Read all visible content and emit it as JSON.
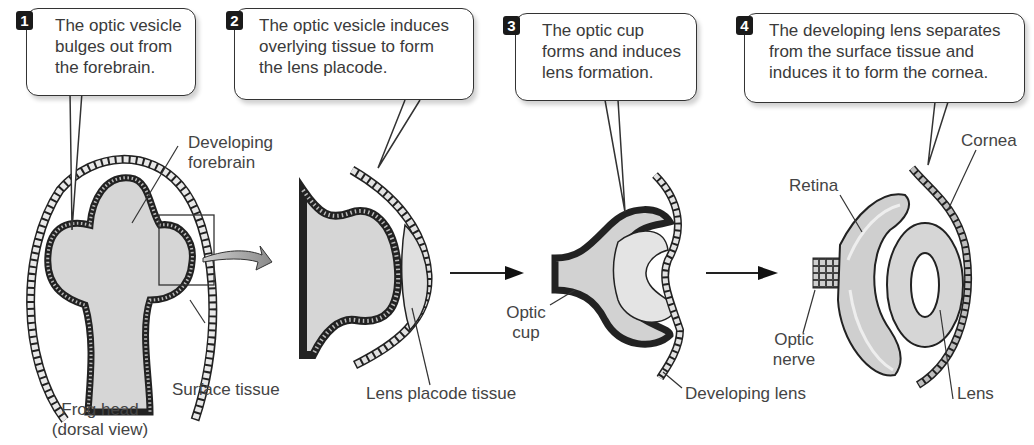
{
  "steps": [
    {
      "number": "1",
      "text_lines": [
        "The optic vesicle",
        "bulges out from",
        "the forebrain."
      ]
    },
    {
      "number": "2",
      "text_lines": [
        "The optic vesicle induces",
        "overlying tissue to form",
        "the lens placode."
      ]
    },
    {
      "number": "3",
      "text_lines": [
        "The optic cup",
        "forms and induces",
        "lens formation."
      ]
    },
    {
      "number": "4",
      "text_lines": [
        "The developing lens separates",
        "from the surface tissue and",
        "induces it to form the cornea."
      ]
    }
  ],
  "labels": {
    "developing_forebrain": [
      "Developing",
      "forebrain"
    ],
    "surface_tissue": "Surface tissue",
    "frog_head": [
      "Frog head",
      "(dorsal view)"
    ],
    "lens_placode_tissue": "Lens placode tissue",
    "optic_cup": [
      "Optic",
      "cup"
    ],
    "developing_lens": "Developing lens",
    "retina": "Retina",
    "cornea": "Cornea",
    "optic_nerve": [
      "Optic",
      "nerve"
    ],
    "lens": "Lens"
  },
  "colors": {
    "tissue_fill": "#d4d4d4",
    "cell_fill": "#c8c8c8",
    "outline": "#222222",
    "badge": "#1a1a1a",
    "curved_arrow": "#9a9a9a"
  }
}
